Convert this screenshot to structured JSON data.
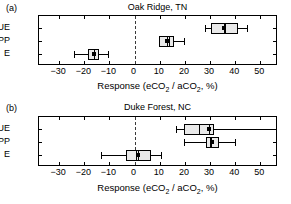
{
  "figure": {
    "axis_title_prefix": "Response (eCO",
    "axis_title_mid": " / aCO",
    "axis_title_suffix": ", %)",
    "sub2": "2",
    "xticks": [
      -30,
      -20,
      -10,
      0,
      10,
      20,
      30,
      40,
      50
    ],
    "xtick_labels": [
      "−30",
      "−20",
      "−10",
      "0",
      "10",
      "20",
      "30",
      "40",
      "50"
    ],
    "xlim": [
      -38,
      57
    ],
    "zero_reference": 0,
    "box_fill": "#e9e9e9",
    "line_color": "#000000",
    "row_labels": [
      "WUE",
      "NPP",
      "E"
    ]
  },
  "chart_data": {
    "type": "box",
    "xlabel": "Response (eCO2 / aCO2, %)",
    "ylabel": "",
    "xlim": [
      -38,
      57
    ],
    "grid": false,
    "legend": "none",
    "panels": [
      {
        "letter": "(a)",
        "title": "Oak Ridge, TN",
        "categories": [
          "WUE",
          "NPP",
          "E"
        ],
        "boxes": [
          {
            "label": "WUE",
            "whisker_low": 28.0,
            "q1": 30.5,
            "median": 36.0,
            "mean": 35.5,
            "q3": 41.0,
            "whisker_high": 44.5
          },
          {
            "label": "NPP",
            "whisker_low": 9.5,
            "q1": 9.8,
            "median": 13.8,
            "mean": 12.8,
            "q3": 15.5,
            "whisker_high": 19.5
          },
          {
            "label": "E",
            "whisker_low": -24.0,
            "q1": -18.5,
            "median": -16.0,
            "mean": -16.3,
            "q3": -14.0,
            "whisker_high": -10.5
          }
        ]
      },
      {
        "letter": "(b)",
        "title": "Duke Forest, NC",
        "categories": [
          "WUE",
          "NPP",
          "E"
        ],
        "boxes": [
          {
            "label": "WUE",
            "whisker_low": 16.5,
            "q1": 19.5,
            "median": 25.5,
            "mean": 29.5,
            "q3": 31.5,
            "whisker_high": 57.0
          },
          {
            "label": "NPP",
            "whisker_low": 19.5,
            "q1": 28.5,
            "median": 30.0,
            "mean": 30.5,
            "q3": 33.5,
            "whisker_high": 40.0
          },
          {
            "label": "E",
            "whisker_low": -13.5,
            "q1": -3.5,
            "median": 0.5,
            "mean": 1.3,
            "q3": 6.5,
            "whisker_high": 10.5
          }
        ]
      }
    ]
  }
}
